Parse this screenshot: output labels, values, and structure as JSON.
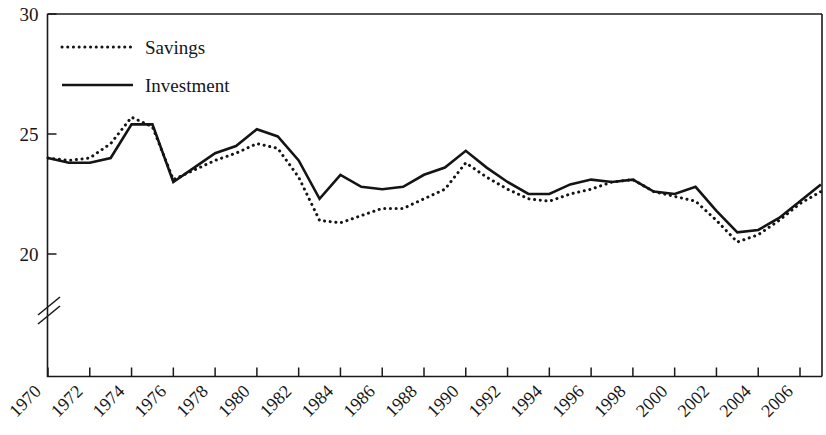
{
  "chart_data": {
    "type": "line",
    "title": "",
    "subtitle": "",
    "xlabel": "",
    "ylabel": "",
    "xlim": [
      1970,
      2007
    ],
    "ylim": [
      18.6,
      30
    ],
    "ylim_visible_from": 19.2,
    "axis_break": true,
    "axis_break_note": "y-axis broken below 20",
    "grid": false,
    "legend_position": "top-left",
    "ytick_labels": [
      "20",
      "25",
      "30"
    ],
    "yticks": [
      20,
      25,
      30
    ],
    "xtick_labels": [
      "1970",
      "1972",
      "1974",
      "1976",
      "1978",
      "1980",
      "1982",
      "1984",
      "1986",
      "1988",
      "1990",
      "1992",
      "1994",
      "1996",
      "1998",
      "2000",
      "2002",
      "2004",
      "2006"
    ],
    "xticks": [
      1970,
      1972,
      1974,
      1976,
      1978,
      1980,
      1982,
      1984,
      1986,
      1988,
      1990,
      1992,
      1994,
      1996,
      1998,
      2000,
      2002,
      2004,
      2006
    ],
    "x": [
      1970,
      1971,
      1972,
      1973,
      1974,
      1975,
      1976,
      1977,
      1978,
      1979,
      1980,
      1981,
      1982,
      1983,
      1984,
      1985,
      1986,
      1987,
      1988,
      1989,
      1990,
      1991,
      1992,
      1993,
      1994,
      1995,
      1996,
      1997,
      1998,
      1999,
      2000,
      2001,
      2002,
      2003,
      2004,
      2005,
      2006,
      2007
    ],
    "series": [
      {
        "name": "Savings",
        "style": "dotted",
        "color": "#141414",
        "values": [
          24.0,
          23.9,
          24.0,
          24.6,
          25.7,
          25.3,
          23.1,
          23.5,
          23.9,
          24.2,
          24.6,
          24.4,
          23.2,
          21.4,
          21.3,
          21.6,
          21.9,
          21.9,
          22.3,
          22.7,
          23.8,
          23.2,
          22.7,
          22.3,
          22.2,
          22.5,
          22.7,
          23.0,
          23.1,
          22.6,
          22.4,
          22.2,
          21.4,
          20.5,
          20.8,
          21.4,
          22.1,
          22.6
        ],
        "label": "Savings"
      },
      {
        "name": "Investment",
        "style": "solid",
        "color": "#141414",
        "values": [
          24.0,
          23.8,
          23.8,
          24.0,
          25.4,
          25.4,
          23.0,
          23.6,
          24.2,
          24.5,
          25.2,
          24.9,
          23.9,
          22.3,
          23.3,
          22.8,
          22.7,
          22.8,
          23.3,
          23.6,
          24.3,
          23.6,
          23.0,
          22.5,
          22.5,
          22.9,
          23.1,
          23.0,
          23.1,
          22.6,
          22.5,
          22.8,
          21.8,
          20.9,
          21.0,
          21.5,
          22.2,
          22.9
        ],
        "label": "Investment"
      }
    ],
    "legend": [
      {
        "label": "Savings",
        "style": "dotted"
      },
      {
        "label": "Investment",
        "style": "solid"
      }
    ]
  },
  "legend": {
    "savings_label": "Savings",
    "investment_label": "Investment"
  }
}
